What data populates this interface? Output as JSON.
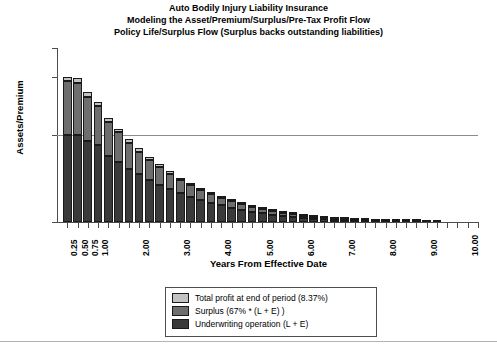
{
  "chart_data": {
    "type": "bar",
    "stacked": true,
    "title": "Auto Bodily Injury Liability Insurance",
    "subtitle": "Modeling the Asset/Premium/Surplus/Pre-Tax Profit Flow",
    "subtitle2": "Policy Life/Surplus Flow (Surplus backs outstanding liabilities)",
    "title_lines": [
      "Auto Bodily Injury Liability Insurance",
      "Modeling the Asset/Premium/Surplus/Pre-Tax Profit Flow",
      "Policy Life/Surplus Flow (Surplus backs outstanding liabilities)"
    ],
    "xlabel": "Years From Effective Date",
    "ylabel": "Assets/Premium",
    "ylim": [
      0.0,
      2.0
    ],
    "xlim": [
      0.0,
      10.25
    ],
    "y_ticks": [
      {
        "value": 2.0,
        "label": "2.00"
      },
      {
        "value": 1.67,
        "label": "1.67"
      },
      {
        "value": 1.0,
        "label": "1.00"
      },
      {
        "value": 0.0,
        "label": "0.00"
      }
    ],
    "x_tick_labels": [
      {
        "x": 0.25,
        "label": "0.25"
      },
      {
        "x": 0.5,
        "label": "0.50"
      },
      {
        "x": 0.75,
        "label": "0.75"
      },
      {
        "x": 1.0,
        "label": "1.00"
      },
      {
        "x": 2.0,
        "label": "2.00"
      },
      {
        "x": 3.0,
        "label": "3.00"
      },
      {
        "x": 4.0,
        "label": "4.00"
      },
      {
        "x": 5.0,
        "label": "5.00"
      },
      {
        "x": 6.0,
        "label": "6.00"
      },
      {
        "x": 7.0,
        "label": "7.00"
      },
      {
        "x": 8.0,
        "label": "8.00"
      },
      {
        "x": 9.0,
        "label": "9.00"
      },
      {
        "x": 10.0,
        "label": "10.00"
      }
    ],
    "x_tick_step": 0.25,
    "x_tick_count": 41,
    "gridlines": [
      {
        "value": 1.0,
        "color": "#8c8c8c"
      }
    ],
    "grid": false,
    "legend_position": "below-center",
    "series": [
      {
        "name": "Underwriting operation (L  + E)",
        "color": "#3a3a3a",
        "values": [
          1.0,
          1.0,
          0.93,
          0.88,
          0.76,
          0.69,
          0.61,
          0.55,
          0.48,
          0.43,
          0.38,
          0.33,
          0.29,
          0.25,
          0.22,
          0.19,
          0.165,
          0.14,
          0.12,
          0.1,
          0.085,
          0.07,
          0.06,
          0.05,
          0.04,
          0.033,
          0.027,
          0.022,
          0.018,
          0.014,
          0.011,
          0.009,
          0.007,
          0.005,
          0.004,
          0.003,
          0.002,
          0.0,
          0.0,
          0.0,
          0.0
        ]
      },
      {
        "name": "Surplus (67% * (L + E) )",
        "color": "#6e6e6e",
        "values": [
          0.62,
          0.6,
          0.51,
          0.45,
          0.39,
          0.34,
          0.3,
          0.26,
          0.23,
          0.2,
          0.175,
          0.15,
          0.13,
          0.115,
          0.1,
          0.087,
          0.075,
          0.065,
          0.055,
          0.047,
          0.039,
          0.033,
          0.028,
          0.023,
          0.019,
          0.016,
          0.013,
          0.01,
          0.008,
          0.007,
          0.005,
          0.004,
          0.003,
          0.003,
          0.002,
          0.002,
          0.001,
          0.0,
          0.0,
          0.0,
          0.0
        ]
      },
      {
        "name": "Total profit at end of period (8.37%)",
        "color": "#c2c2c2",
        "values": [
          0.05,
          0.05,
          0.05,
          0.05,
          0.045,
          0.042,
          0.04,
          0.038,
          0.035,
          0.032,
          0.03,
          0.028,
          0.026,
          0.024,
          0.022,
          0.02,
          0.018,
          0.016,
          0.015,
          0.013,
          0.012,
          0.01,
          0.009,
          0.008,
          0.007,
          0.006,
          0.005,
          0.005,
          0.004,
          0.003,
          0.003,
          0.002,
          0.002,
          0.002,
          0.001,
          0.001,
          0.001,
          0.0,
          0.0,
          0.0,
          0.0
        ]
      }
    ],
    "bar_x_positions": [
      0.25,
      0.5,
      0.75,
      1.0,
      1.25,
      1.5,
      1.75,
      2.0,
      2.25,
      2.5,
      2.75,
      3.0,
      3.25,
      3.5,
      3.75,
      4.0,
      4.25,
      4.5,
      4.75,
      5.0,
      5.25,
      5.5,
      5.75,
      6.0,
      6.25,
      6.5,
      6.75,
      7.0,
      7.25,
      7.5,
      7.75,
      8.0,
      8.25,
      8.5,
      8.75,
      9.0,
      9.25,
      9.5,
      9.75,
      10.0,
      10.25
    ]
  },
  "legend": {
    "items": [
      {
        "label": "Total profit at end of period (8.37%)",
        "color": "#c2c2c2"
      },
      {
        "label": "Surplus (67% * (L + E) )",
        "color": "#6e6e6e"
      },
      {
        "label": "Underwriting operation (L  + E)",
        "color": "#3a3a3a"
      }
    ]
  }
}
